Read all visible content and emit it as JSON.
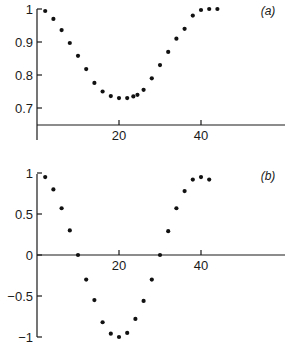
{
  "chart_data": [
    {
      "type": "scatter",
      "panel_label": "(a)",
      "title": "",
      "xlabel": "",
      "ylabel": "",
      "xlim": [
        0,
        60
      ],
      "ylim": [
        0.65,
        1.0
      ],
      "x_ticks": [
        20,
        40
      ],
      "x_tick_labels": [
        "20",
        "40"
      ],
      "y_ticks": [
        1.0,
        0.9,
        0.8,
        0.7
      ],
      "y_tick_labels": [
        "1",
        "0.9",
        "0.8",
        "0.7"
      ],
      "grid": false,
      "legend": null,
      "series": [
        {
          "name": "a",
          "x": [
            2,
            4,
            6,
            8,
            10,
            12,
            14,
            16,
            18,
            20,
            22,
            23.5,
            24.5,
            26,
            28,
            30,
            32,
            34,
            36,
            38,
            40,
            42,
            44
          ],
          "y": [
            0.994,
            0.97,
            0.936,
            0.897,
            0.858,
            0.818,
            0.776,
            0.75,
            0.736,
            0.73,
            0.73,
            0.735,
            0.74,
            0.755,
            0.79,
            0.83,
            0.87,
            0.91,
            0.94,
            0.98,
            0.997,
            1.0,
            1.0
          ]
        }
      ]
    },
    {
      "type": "scatter",
      "panel_label": "(b)",
      "title": "",
      "xlabel": "",
      "ylabel": "",
      "xlim": [
        0,
        60
      ],
      "ylim": [
        -1.0,
        1.0
      ],
      "x_ticks": [
        20,
        40
      ],
      "x_tick_labels": [
        "20",
        "40"
      ],
      "y_ticks": [
        1,
        0.5,
        0,
        -0.5,
        -1
      ],
      "y_tick_labels": [
        "1",
        "0.5",
        "0",
        "-0.5",
        "-1"
      ],
      "grid": false,
      "legend": null,
      "series": [
        {
          "name": "b",
          "x": [
            2,
            4,
            6,
            8,
            10,
            12,
            14,
            16,
            18,
            20,
            22,
            24,
            26,
            28,
            30,
            32,
            34,
            36,
            38,
            40,
            42
          ],
          "y": [
            0.95,
            0.8,
            0.57,
            0.3,
            0.0,
            -0.3,
            -0.55,
            -0.82,
            -0.96,
            -1.0,
            -0.95,
            -0.78,
            -0.56,
            -0.3,
            0.0,
            0.29,
            0.57,
            0.78,
            0.92,
            0.95,
            0.92
          ]
        }
      ]
    }
  ]
}
